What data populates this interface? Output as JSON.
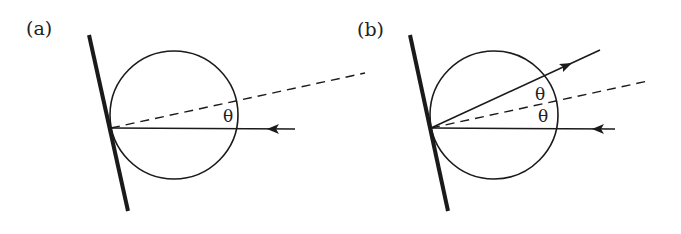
{
  "figure": {
    "panels": [
      {
        "id": "a",
        "label": "(a)",
        "angle_labels": [
          "θ"
        ],
        "description": "Ray incident horizontally on a sphere touching a tilted wall; dashed normal line at angle θ"
      },
      {
        "id": "b",
        "label": "(b)",
        "angle_labels": [
          "θ",
          "θ"
        ],
        "description": "Incident ray and reflected ray, each at angle θ from the dashed normal line"
      }
    ],
    "colors": {
      "stroke": "#1a1a1a",
      "background": "#ffffff"
    }
  }
}
